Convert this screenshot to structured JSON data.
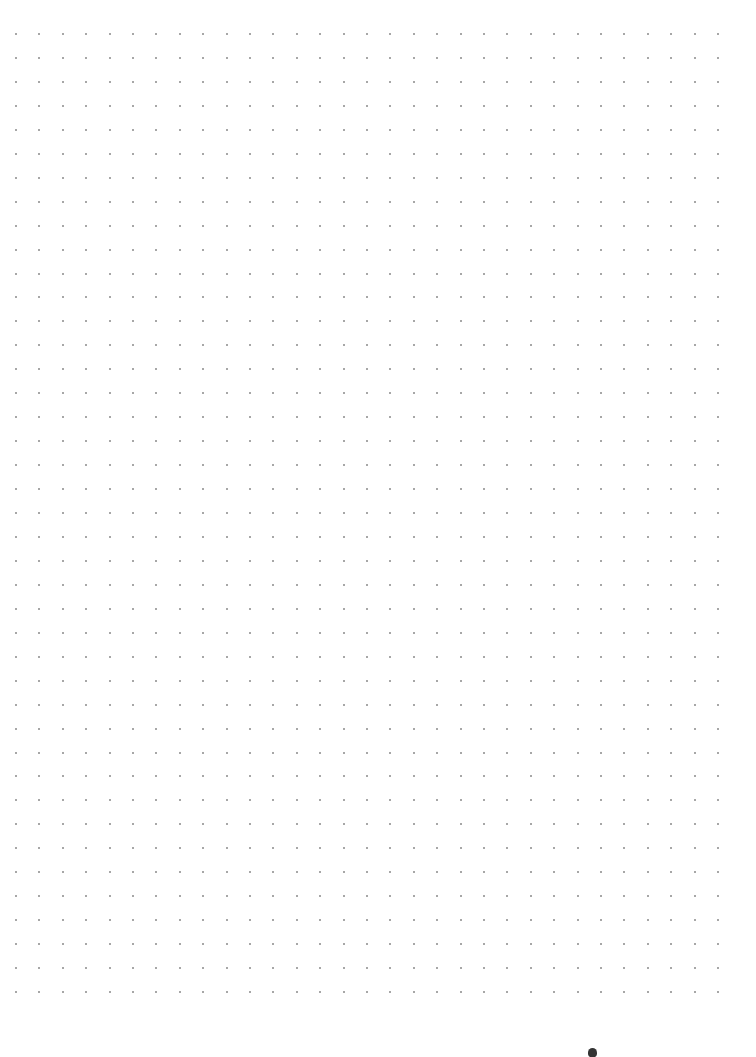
{
  "page": {
    "background": "#ffffff",
    "type": "dot-grid-paper"
  },
  "dot_grid": {
    "columns": 31,
    "rows": 41,
    "origin_x": 16,
    "origin_y": 34,
    "spacing_x": 23.4,
    "spacing_y": 23.95,
    "dot_color": "#8a8a8a",
    "dot_size": 2
  },
  "marker": {
    "x": 588,
    "y": 1048,
    "color": "#333333"
  }
}
